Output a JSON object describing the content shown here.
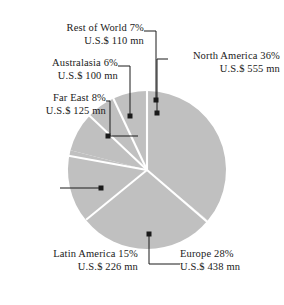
{
  "chart_data": {
    "type": "pie",
    "title": "",
    "subtitle": "",
    "xlabel": "",
    "ylabel": "",
    "grid": false,
    "legend_position": "none",
    "label_format": "{name} {percent}% / U.S.$ {value} mn",
    "units": "U.S.$ mn",
    "total_value": 1554,
    "categories": [
      "North America",
      "Europe",
      "Latin America",
      "Far East",
      "Australasia",
      "Rest of World"
    ],
    "values": [
      555,
      438,
      226,
      125,
      100,
      110
    ],
    "percents": [
      36,
      28,
      15,
      8,
      6,
      7
    ],
    "slices": [
      {
        "name": "North America",
        "percent": 36,
        "value": 555,
        "start_angle": 0,
        "end_angle": 129.6,
        "color": "#c0c0c0"
      },
      {
        "name": "Europe",
        "percent": 28,
        "value": 438,
        "start_angle": 129.6,
        "end_angle": 230.4,
        "color": "#c0c0c0"
      },
      {
        "name": "Latin America",
        "percent": 15,
        "value": 226,
        "start_angle": 230.4,
        "end_angle": 284.4,
        "color": "#c0c0c0"
      },
      {
        "name": "Far East",
        "percent": 8,
        "value": 125,
        "start_angle": 284.4,
        "end_angle": 313.2,
        "color": "#c0c0c0"
      },
      {
        "name": "Australasia",
        "percent": 6,
        "value": 100,
        "start_angle": 313.2,
        "end_angle": 334.8,
        "color": "#c0c0c0"
      },
      {
        "name": "Rest of World",
        "percent": 7,
        "value": 110,
        "start_angle": 334.8,
        "end_angle": 360,
        "color": "#c0c0c0"
      }
    ]
  },
  "labels": {
    "rest_of_world": {
      "line1": "Rest of World  7%",
      "line2": "U.S.$ 110 mn"
    },
    "australasia": {
      "line1": "Australasia  6%",
      "line2": "U.S.$ 100 mn"
    },
    "far_east": {
      "line1": "Far East  8%",
      "line2": "U.S.$ 125 mn"
    },
    "north_america": {
      "line1": "North America  36%",
      "line2": "U.S.$ 555 mn"
    },
    "latin_america": {
      "line1": "Latin America  15%",
      "line2": "U.S.$ 226 mn"
    },
    "europe": {
      "line1": "Europe  28%",
      "line2": "U.S.$ 438 mn"
    }
  },
  "style": {
    "slice_fill": "#c0c0c0",
    "separator_color": "#ffffff",
    "leader_color": "#1a1a1a",
    "text_color": "#1a1a1a",
    "background": "#ffffff"
  }
}
